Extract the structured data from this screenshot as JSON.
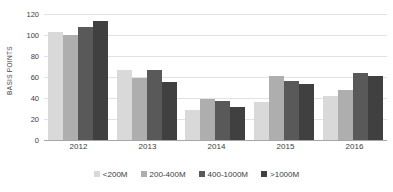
{
  "chart_data": {
    "type": "bar",
    "title": "",
    "subtitle": "",
    "xlabel": "",
    "ylabel": "BASIS POINTS",
    "categories": [
      "2012",
      "2013",
      "2014",
      "2015",
      "2016"
    ],
    "series": [
      {
        "name": "<200M",
        "color": "#d9d9d9",
        "values": [
          103,
          67,
          29,
          36,
          42
        ]
      },
      {
        "name": "200-400M",
        "color": "#aeaeae",
        "values": [
          100,
          59,
          39,
          61,
          48
        ]
      },
      {
        "name": "400-1000M",
        "color": "#595959",
        "values": [
          108,
          67,
          37,
          56,
          64
        ]
      },
      {
        "name": ">1000M",
        "color": "#404040",
        "values": [
          113,
          55,
          31,
          53,
          61
        ]
      }
    ],
    "ylim": [
      0,
      120
    ],
    "yticks": [
      0,
      20,
      40,
      60,
      80,
      100,
      120
    ],
    "ytick_labels": [
      "0",
      "20",
      "40",
      "60",
      "80",
      "100",
      "120"
    ],
    "grid": true,
    "legend_position": "bottom",
    "gridline_color": "#e2e2e2",
    "axis_color": "#a6a6a6",
    "background": "#ffffff"
  }
}
